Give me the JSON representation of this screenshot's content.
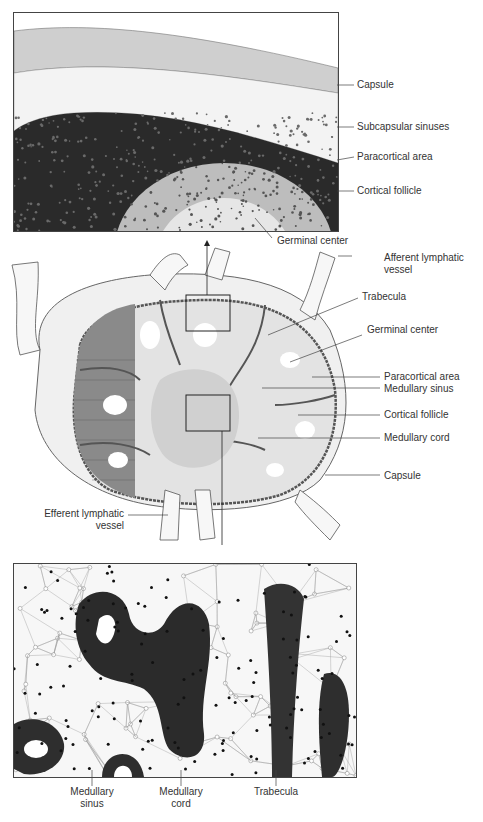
{
  "figure": {
    "top_panel": {
      "labels": {
        "capsule": "Capsule",
        "subcapsular_sinuses": "Subcapsular sinuses",
        "paracortical_area": "Paracortical area",
        "cortical_follicle": "Cortical follicle",
        "germinal_center": "Germinal center"
      }
    },
    "middle_panel": {
      "labels": {
        "afferent_line1": "Afferent lymphatic",
        "afferent_line2": "vessel",
        "trabecula": "Trabecula",
        "germinal_center": "Germinal center",
        "paracortical_area": "Paracortical area",
        "medullary_sinus": "Medullary sinus",
        "cortical_follicle": "Cortical follicle",
        "medullary_cord": "Medullary cord",
        "capsule": "Capsule",
        "efferent_line1": "Efferent lymphatic",
        "efferent_line2": "vessel"
      }
    },
    "bottom_panel": {
      "labels": {
        "medullary_sinus_line1": "Medullary",
        "medullary_sinus_line2": "sinus",
        "medullary_cord_line1": "Medullary",
        "medullary_cord_line2": "cord",
        "trabecula": "Trabecula"
      }
    }
  }
}
